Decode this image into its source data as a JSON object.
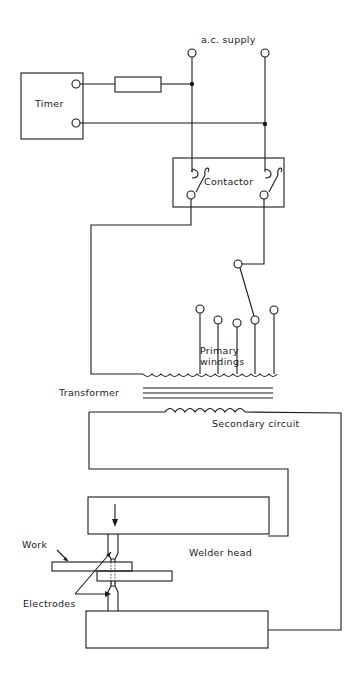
{
  "diagram": {
    "labels": {
      "ac_supply": "a.c. supply",
      "timer": "Timer",
      "contactor": "Contactor",
      "primary_windings_line1": "Primary",
      "primary_windings_line2": "windings",
      "transformer": "Transformer",
      "secondary_circuit": "Secondary circuit",
      "welder_head": "Welder head",
      "work": "Work",
      "electrodes": "Electrodes"
    },
    "components": [
      "a.c. supply terminals",
      "Timer",
      "Resistor",
      "Contactor",
      "Tap selector",
      "Primary windings (5 taps)",
      "Transformer core",
      "Secondary coil",
      "Upper welder arm",
      "Lower welder arm",
      "Electrodes",
      "Work pieces"
    ],
    "colors": {
      "line": "#1a1a1a",
      "background": "#ffffff"
    }
  }
}
